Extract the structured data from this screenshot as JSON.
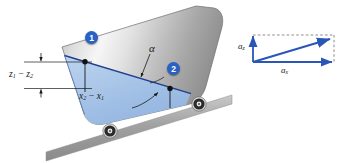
{
  "figure": {
    "colors": {
      "liquid_fill": "#a9c6e8",
      "liquid_edge": "#1f3f8f",
      "vector_blue": "#2a56b8",
      "marker_blue": "#2a62c4",
      "tank_metal_light": "#f2f2f2",
      "tank_metal_dark": "#9a9a9a",
      "incline_grey": "#9d9d9d",
      "text": "#1a1a1a"
    }
  },
  "tank": {
    "point_markers": [
      {
        "id": "1",
        "label": "1"
      },
      {
        "id": "2",
        "label": "2"
      }
    ],
    "angle_label": "α",
    "dimensions": {
      "vertical": {
        "var1": "z",
        "sub1": "1",
        "op": "−",
        "var2": "z",
        "sub2": "2"
      },
      "horizontal": {
        "var1": "x",
        "sub1": "2",
        "op": "−",
        "var2": "x",
        "sub2": "1"
      }
    },
    "wheels": [
      {
        "name": "rear-wheel"
      },
      {
        "name": "front-wheel"
      }
    ]
  },
  "vector_diagram": {
    "vertical_component": {
      "var": "a",
      "sub": "z"
    },
    "horizontal_component": {
      "var": "a",
      "sub": "x"
    },
    "resultant": {
      "name": "resultant-acceleration-vector"
    }
  }
}
